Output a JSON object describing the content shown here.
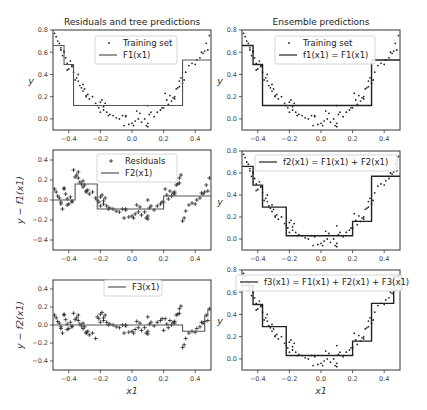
{
  "figure": {
    "col_titles": [
      "Residuals and tree predictions",
      "Ensemble predictions"
    ],
    "colors": {
      "points": "#222222",
      "line": "#222222",
      "line_left": "#555555",
      "frame": "#333333",
      "legend_border": "#cccccc"
    }
  },
  "chart_data": [
    {
      "id": "r1c1",
      "type": "scatter+step",
      "title": "Residuals and tree predictions",
      "xlabel": "",
      "ylabel": "y",
      "xlim": [
        -0.5,
        0.5
      ],
      "ylim": [
        -0.1,
        0.8
      ],
      "xticks": [
        -0.4,
        -0.2,
        0.0,
        0.2,
        0.4
      ],
      "yticks": [
        0.0,
        0.2,
        0.4,
        0.6,
        0.8
      ],
      "legend": [
        "Training set",
        "F1(x1)"
      ],
      "marker": "dot",
      "step": {
        "name": "F1(x1)",
        "edges": [
          -0.5,
          -0.43,
          -0.37,
          0.32,
          0.5
        ],
        "values": [
          0.66,
          0.49,
          0.12,
          0.53
        ]
      }
    },
    {
      "id": "r1c2",
      "type": "scatter+step",
      "title": "Ensemble predictions",
      "xlabel": "",
      "ylabel": "y",
      "xlim": [
        -0.5,
        0.5
      ],
      "ylim": [
        -0.1,
        0.8
      ],
      "xticks": [
        -0.4,
        -0.2,
        0.0,
        0.2,
        0.4
      ],
      "yticks": [
        0.0,
        0.2,
        0.4,
        0.6,
        0.8
      ],
      "legend": [
        "Training set",
        "f1(x1) = F1(x1)"
      ],
      "marker": "dot",
      "step": {
        "name": "f1(x1)",
        "edges": [
          -0.5,
          -0.43,
          -0.37,
          0.32,
          0.5
        ],
        "values": [
          0.66,
          0.49,
          0.12,
          0.53
        ]
      }
    },
    {
      "id": "r2c1",
      "type": "scatter+step",
      "title": "",
      "xlabel": "",
      "ylabel": "y − f1(x1)",
      "xlim": [
        -0.5,
        0.5
      ],
      "ylim": [
        -0.5,
        0.5
      ],
      "xticks": [
        -0.4,
        -0.2,
        0.0,
        0.2,
        0.4
      ],
      "yticks": [
        -0.4,
        -0.2,
        0.0,
        0.2,
        0.4
      ],
      "legend": [
        "Residuals",
        "F2(x1)"
      ],
      "marker": "plus",
      "step": {
        "name": "F2(x1)",
        "edges": [
          -0.5,
          -0.36,
          -0.22,
          0.2,
          0.5
        ],
        "values": [
          0.0,
          0.16,
          -0.09,
          0.04
        ]
      }
    },
    {
      "id": "r2c2",
      "type": "scatter+step",
      "title": "",
      "xlabel": "",
      "ylabel": "y",
      "xlim": [
        -0.5,
        0.5
      ],
      "ylim": [
        -0.1,
        0.8
      ],
      "xticks": [
        -0.4,
        -0.2,
        0.0,
        0.2,
        0.4
      ],
      "yticks": [
        0.0,
        0.2,
        0.4,
        0.6,
        0.8
      ],
      "legend": [
        "f2(x1) = F1(x1) + F2(x1)"
      ],
      "marker": "dot",
      "step": {
        "name": "f2(x1)",
        "edges": [
          -0.5,
          -0.43,
          -0.37,
          -0.22,
          0.2,
          0.32,
          0.5
        ],
        "values": [
          0.66,
          0.49,
          0.29,
          0.03,
          0.16,
          0.57
        ]
      }
    },
    {
      "id": "r3c1",
      "type": "scatter+step",
      "title": "",
      "xlabel": "x1",
      "ylabel": "y − f2(x1)",
      "xlim": [
        -0.5,
        0.5
      ],
      "ylim": [
        -0.5,
        0.5
      ],
      "xticks": [
        -0.4,
        -0.2,
        0.0,
        0.2,
        0.4
      ],
      "yticks": [
        -0.4,
        -0.2,
        0.0,
        0.2,
        0.4
      ],
      "legend": [
        "F3(x1)"
      ],
      "marker": "plus",
      "step": {
        "name": "F3(x1)",
        "edges": [
          -0.5,
          0.32,
          0.46,
          0.48,
          0.5
        ],
        "values": [
          0.0,
          -0.07,
          0.1,
          0.17
        ]
      }
    },
    {
      "id": "r3c2",
      "type": "scatter+step",
      "title": "",
      "xlabel": "x1",
      "ylabel": "y",
      "xlim": [
        -0.5,
        0.5
      ],
      "ylim": [
        -0.1,
        0.8
      ],
      "xticks": [
        -0.4,
        -0.2,
        0.0,
        0.2,
        0.4
      ],
      "yticks": [
        0.0,
        0.2,
        0.4,
        0.6,
        0.8
      ],
      "legend": [
        "f3(x1) = F1(x1) + F2(x1) + F3(x1)"
      ],
      "marker": "dot",
      "step": {
        "name": "f3(x1)",
        "edges": [
          -0.5,
          -0.43,
          -0.37,
          -0.22,
          0.2,
          0.32,
          0.46,
          0.5
        ],
        "values": [
          0.66,
          0.49,
          0.29,
          0.03,
          0.16,
          0.5,
          0.74
        ]
      }
    }
  ],
  "training_points": {
    "note": "approximate quadratic y = 3x^2 + noise, 100 samples in [-0.5,0.5]",
    "x": [
      -0.49,
      -0.48,
      -0.47,
      -0.46,
      -0.45,
      -0.44,
      -0.43,
      -0.42,
      -0.41,
      -0.4,
      -0.39,
      -0.38,
      -0.37,
      -0.36,
      -0.35,
      -0.34,
      -0.33,
      -0.32,
      -0.31,
      -0.3,
      -0.29,
      -0.28,
      -0.27,
      -0.25,
      -0.23,
      -0.22,
      -0.21,
      -0.2,
      -0.19,
      -0.18,
      -0.17,
      -0.16,
      -0.15,
      -0.14,
      -0.12,
      -0.1,
      -0.08,
      -0.06,
      -0.05,
      -0.04,
      -0.02,
      0.0,
      0.01,
      0.02,
      0.03,
      0.05,
      0.06,
      0.08,
      0.09,
      0.1,
      0.11,
      0.12,
      0.14,
      0.16,
      0.18,
      0.2,
      0.21,
      0.22,
      0.23,
      0.24,
      0.25,
      0.26,
      0.27,
      0.28,
      0.29,
      0.3,
      0.31,
      0.32,
      0.33,
      0.34,
      0.36,
      0.38,
      0.4,
      0.41,
      0.43,
      0.44,
      0.45,
      0.46,
      0.47,
      0.48,
      0.49,
      -0.45,
      -0.43,
      -0.41,
      -0.38,
      -0.34,
      -0.31,
      -0.29,
      -0.2,
      -0.18,
      0.1,
      0.1,
      0.04,
      -0.04,
      0.19,
      0.27,
      0.3
    ],
    "y": [
      0.77,
      0.74,
      0.7,
      0.68,
      0.64,
      0.57,
      0.6,
      0.55,
      0.5,
      0.45,
      0.52,
      0.48,
      0.42,
      0.35,
      0.37,
      0.34,
      0.3,
      0.28,
      0.25,
      0.27,
      0.21,
      0.22,
      0.18,
      0.2,
      0.14,
      0.12,
      0.1,
      0.06,
      0.17,
      0.08,
      0.14,
      0.06,
      0.03,
      0.04,
      0.03,
      0.01,
      0.0,
      0.03,
      -0.06,
      0.02,
      -0.05,
      -0.04,
      -0.06,
      -0.02,
      0.07,
      0.05,
      -0.03,
      0.0,
      -0.06,
      0.12,
      0.04,
      0.06,
      0.02,
      0.06,
      0.08,
      0.1,
      0.23,
      0.17,
      0.13,
      0.21,
      0.16,
      0.19,
      0.2,
      0.27,
      0.28,
      0.34,
      0.37,
      0.32,
      0.35,
      0.42,
      0.48,
      0.5,
      0.49,
      0.53,
      0.55,
      0.6,
      0.59,
      0.61,
      0.68,
      0.62,
      0.75,
      0.62,
      0.61,
      0.44,
      0.47,
      0.4,
      0.31,
      0.2,
      0.15,
      0.11,
      -0.07,
      -0.04,
      0.0,
      0.03,
      0.1,
      0.18,
      0.29
    ]
  }
}
